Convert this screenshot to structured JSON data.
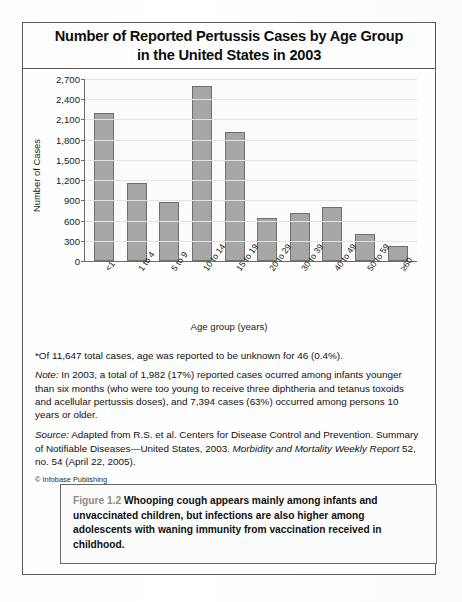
{
  "figure": {
    "title_line1": "Number of Reported Pertussis Cases by Age Group",
    "title_line2": "in the United States in 2003",
    "caption_label": "Figure 1.2",
    "caption_body": "Whooping cough appears mainly among infants and unvaccinated children, but infections are also higher among adolescents with waning immunity from vaccination received in childhood.",
    "copyright": "© Infobase Publishing"
  },
  "notes": {
    "asterisk": "*Of 11,647 total cases, age was reported to be unknown for 46 (0.4%).",
    "note_label": "Note:",
    "note_body": " In 2003, a total of 1,982 (17%) reported cases ocurred among infants younger than six months (who were too young to receive three diphtheria and tetanus toxoids and acellular pertussis doses), and 7,394 cases (63%) occurred among persons 10 years or older.",
    "source_label": "Source:",
    "source_part1": " Adapted from R.S. et al. Centers for Disease Control and Prevention. Summary of Notifiable Diseases—United States, 2003. ",
    "source_italic": "Morbidity and Mortality Weekly Report",
    "source_part2": " 52, no. 54 (April 22, 2005)."
  },
  "chart_data": {
    "type": "bar",
    "title": "Number of Reported Pertussis Cases by Age Group in the United States in 2003",
    "xlabel": "Age group (years)",
    "ylabel": "Number of Cases",
    "categories": [
      "<1",
      "1 to 4",
      "5 to 9",
      "10 to 14",
      "15 to 19",
      "20 to 29",
      "30 to 39",
      "40 to 49",
      "50 to 59",
      "≥60"
    ],
    "values": [
      2200,
      1160,
      870,
      2600,
      1920,
      640,
      710,
      800,
      400,
      220
    ],
    "ylim": [
      0,
      2700
    ],
    "ytick_values": [
      0,
      300,
      600,
      900,
      1200,
      1500,
      1800,
      2100,
      2400,
      2700
    ],
    "ytick_labels": [
      "0",
      "300",
      "600",
      "900",
      "1,200",
      "1,500",
      "1,800",
      "2,100",
      "2,400",
      "2,700"
    ],
    "grid": true,
    "legend": "none",
    "bar_color": "#a6a6a6",
    "bar_border_color": "#6f6f6f"
  }
}
